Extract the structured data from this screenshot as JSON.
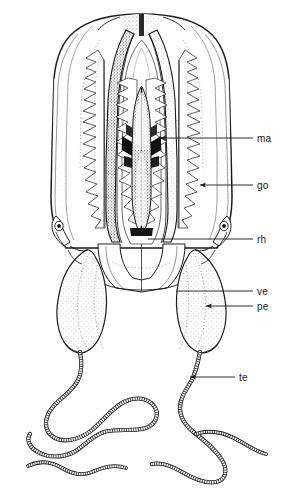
{
  "figure": {
    "kind": "scientific-line-drawing",
    "view": "lateral-whole-animal",
    "background_color": "#fefefe",
    "ink_color": "#1a1a1a",
    "stipple_color": "#5c5c5c",
    "width": 283,
    "height": 496
  },
  "labels": [
    {
      "id": "ma",
      "text": "ma",
      "meaning": "manubrium",
      "text_x": 257,
      "text_y": 133,
      "leader_from_x": 253,
      "leader_from_y": 138,
      "leader_to_x": 160,
      "leader_to_y": 138,
      "arrow": true,
      "arrow_x": 160,
      "arrow_y": 138
    },
    {
      "id": "go",
      "text": "go",
      "meaning": "gonad",
      "text_x": 257,
      "text_y": 180,
      "leader_from_x": 253,
      "leader_from_y": 185,
      "leader_to_x": 200,
      "leader_to_y": 185,
      "arrow": true,
      "arrow_x": 200,
      "arrow_y": 185
    },
    {
      "id": "rh",
      "text": "rh",
      "meaning": "rhopalium",
      "text_x": 257,
      "text_y": 234,
      "leader_from_x": 253,
      "leader_from_y": 239,
      "leader_to_x": 148,
      "leader_to_y": 239,
      "arrow": false,
      "arrow_x": 148,
      "arrow_y": 239
    },
    {
      "id": "ve",
      "text": "ve",
      "meaning": "velum",
      "text_x": 257,
      "text_y": 286,
      "leader_from_x": 253,
      "leader_from_y": 291,
      "leader_to_x": 176,
      "leader_to_y": 291,
      "arrow": false,
      "arrow_x": 176,
      "arrow_y": 291
    },
    {
      "id": "pe",
      "text": "pe",
      "meaning": "peduncle",
      "text_x": 257,
      "text_y": 301,
      "leader_from_x": 253,
      "leader_from_y": 306,
      "leader_to_x": 206,
      "leader_to_y": 306,
      "arrow": true,
      "arrow_x": 206,
      "arrow_y": 306
    },
    {
      "id": "te",
      "text": "te",
      "meaning": "tentacle",
      "text_x": 239,
      "text_y": 372,
      "leader_from_x": 235,
      "leader_from_y": 377,
      "leader_to_x": 190,
      "leader_to_y": 377,
      "arrow": true,
      "arrow_x": 190,
      "arrow_y": 377
    }
  ],
  "anatomy_parts": [
    {
      "name": "bell-umbrella",
      "description": "large rounded exumbrella outline"
    },
    {
      "name": "apex-stipple",
      "description": "dark stippled wedge at bell apex"
    },
    {
      "name": "radial-canal-left",
      "description": "long vertical canal, left"
    },
    {
      "name": "radial-canal-right",
      "description": "long vertical canal, right"
    },
    {
      "name": "manubrium",
      "description": "central dark stomach with lateral diverticula"
    },
    {
      "name": "gonad-left",
      "description": "crenulated folded ribbon, left"
    },
    {
      "name": "gonad-right",
      "description": "crenulated folded ribbon, right"
    },
    {
      "name": "rhopalium-left",
      "description": "marginal sense organ, left bell rim"
    },
    {
      "name": "rhopalium-right",
      "description": "marginal sense organ, right bell rim"
    },
    {
      "name": "velum",
      "description": "thin membrane across bell opening"
    },
    {
      "name": "peduncle-left",
      "description": "pendant stippled bulb, left"
    },
    {
      "name": "peduncle-right",
      "description": "pendant stippled bulb, right"
    },
    {
      "name": "tentacle-left",
      "description": "long annulated sinuous tentacle, left"
    },
    {
      "name": "tentacle-right",
      "description": "long annulated sinuous tentacle, right"
    }
  ]
}
